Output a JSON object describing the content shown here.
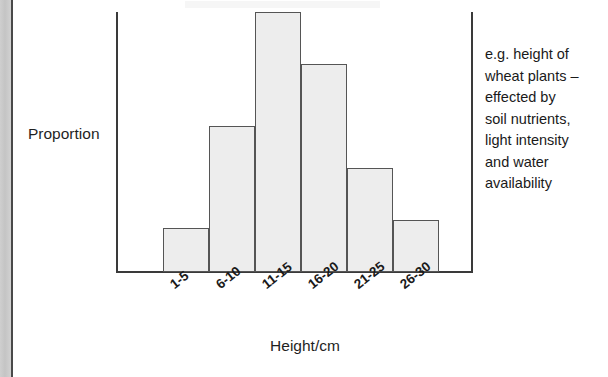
{
  "figure": {
    "y_axis_label": "Proportion",
    "x_axis_title": "Height/cm"
  },
  "annotation": {
    "lines": [
      "e.g. height of",
      "wheat plants –",
      "effected by",
      "soil nutrients,",
      "light intensity",
      "and water",
      "availability"
    ]
  },
  "colors": {
    "bar_fill": "#ededed",
    "bar_border": "#555555",
    "axis": "#3a3a3a",
    "text": "#1a1a1a",
    "page_edge": "#c9c9c9"
  },
  "chart_data": {
    "type": "bar",
    "title": "",
    "subtitle": "",
    "xlabel": "Height/cm",
    "ylabel": "Proportion",
    "categories": [
      "1-5",
      "6-10",
      "11-15",
      "16-20",
      "21-25",
      "26-30"
    ],
    "values": [
      0.17,
      0.56,
      1.0,
      0.8,
      0.4,
      0.2
    ],
    "ylim": [
      0,
      1.0
    ],
    "grid": false,
    "legend": "none",
    "axis_ticks_rotated": true,
    "note": "Normal distribution of continuous variation; bar heights read as proportions relative to the tallest class (11-15)."
  }
}
